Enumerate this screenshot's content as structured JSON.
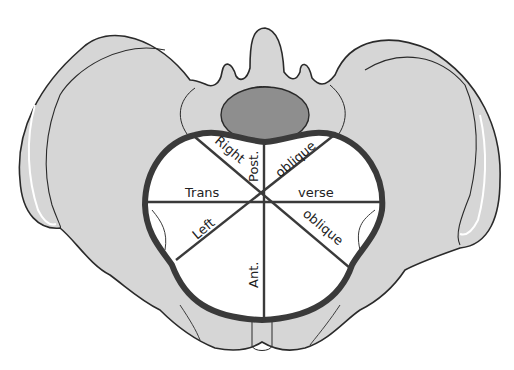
{
  "diagram": {
    "colors": {
      "bone": "#d6d6d6",
      "bone_outline": "#2a2a2a",
      "sacral_body": "#8e8e8e",
      "inlet_fill": "#ffffff",
      "inlet_outline": "#3a3a3a",
      "diameter_line": "#3a3a3a",
      "highlight": "#ffffff"
    },
    "labels": {
      "right": "Right",
      "post": "Post.",
      "oblique_top": "oblique",
      "trans": "Trans",
      "verse": "verse",
      "left": "Left",
      "oblique_bottom": "oblique",
      "ant": "Ant."
    }
  }
}
